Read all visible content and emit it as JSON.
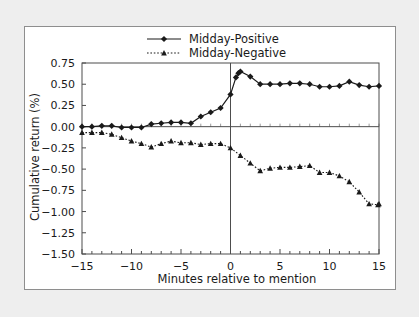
{
  "figure": {
    "background_color": "#eeeeee",
    "panel_color": "#ffffff",
    "ink_color": "#1a1a1a"
  },
  "chart_data": {
    "type": "line",
    "title": "",
    "subtitle": "",
    "xlabel": "Minutes relative to mention",
    "ylabel": "Cumulative return (%)",
    "xlim": [
      -15,
      15
    ],
    "ylim": [
      -1.5,
      0.75
    ],
    "xticks": [
      -15,
      -10,
      -5,
      0,
      5,
      10,
      15
    ],
    "xtick_labels": [
      "−15",
      "−10",
      "−5",
      "0",
      "5",
      "10",
      "15"
    ],
    "yticks": [
      0.75,
      0.5,
      0.25,
      0.0,
      -0.25,
      -0.5,
      -0.75,
      -1.0,
      -1.25,
      -1.5
    ],
    "ytick_labels": [
      "0.75",
      "0.50",
      "0.25",
      "0.00",
      "−0.25",
      "−0.50",
      "−0.75",
      "−1.00",
      "−1.25",
      "−1.50"
    ],
    "grid": false,
    "legend_position": "top-center",
    "zero_reference_lines": {
      "horizontal_y": 0.0,
      "vertical_x": 0.0
    },
    "x": [
      -15,
      -14,
      -13,
      -12,
      -11,
      -10,
      -9,
      -8,
      -7,
      -6,
      -5,
      -4,
      -3,
      -2,
      -1,
      0,
      1,
      2,
      3,
      4,
      5,
      6,
      7,
      8,
      9,
      10,
      11,
      12,
      13,
      14,
      15
    ],
    "series": [
      {
        "name": "Midday-Positive",
        "marker": "diamond",
        "linestyle": "solid",
        "color": "#1a1a1a",
        "values": [
          0.0,
          0.0,
          0.01,
          0.01,
          -0.01,
          -0.01,
          -0.01,
          0.03,
          0.04,
          0.05,
          0.05,
          0.04,
          0.12,
          0.17,
          0.22,
          0.38,
          0.65,
          0.59,
          0.5,
          0.5,
          0.5,
          0.51,
          0.51,
          0.5,
          0.47,
          0.47,
          0.48,
          0.53,
          0.49,
          0.47,
          0.48
        ]
      },
      {
        "name": "Midday-Negative",
        "marker": "triangle",
        "linestyle": "dotted",
        "color": "#1a1a1a",
        "values": [
          -0.07,
          -0.07,
          -0.07,
          -0.09,
          -0.13,
          -0.17,
          -0.2,
          -0.24,
          -0.2,
          -0.17,
          -0.19,
          -0.19,
          -0.21,
          -0.2,
          -0.2,
          -0.25,
          -0.34,
          -0.43,
          -0.52,
          -0.49,
          -0.48,
          -0.48,
          -0.47,
          -0.46,
          -0.54,
          -0.54,
          -0.58,
          -0.65,
          -0.77,
          -0.91,
          -0.91
        ]
      }
    ],
    "extra_points": [
      {
        "series": "Midday-Positive",
        "x": 0.55,
        "y": 0.58,
        "note": "intermediate point just after mention"
      },
      {
        "series": "Midday-Positive",
        "x": 0.8,
        "y": 0.63,
        "note": "intermediate point near peak"
      },
      {
        "series": "Midday-Negative",
        "x": 14.9,
        "y": -0.92,
        "note": "final point"
      }
    ],
    "annotations": []
  },
  "legend": {
    "items": [
      {
        "label": "Midday-Positive",
        "marker": "diamond",
        "linestyle": "solid"
      },
      {
        "label": "Midday-Negative",
        "marker": "triangle",
        "linestyle": "dotted"
      }
    ]
  }
}
